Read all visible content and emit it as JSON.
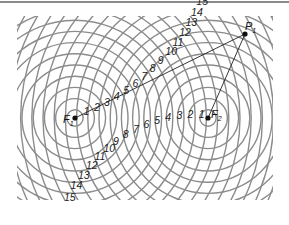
{
  "figure": {
    "sources": [
      {
        "id": "F1",
        "label": "F",
        "subscript": "1"
      },
      {
        "id": "F2",
        "label": "F",
        "subscript": "2"
      }
    ],
    "point": {
      "id": "P1",
      "label": "P",
      "subscript": "1"
    },
    "f1_ring_labels": [
      "1",
      "2",
      "3",
      "4",
      "5",
      "6",
      "7",
      "8",
      "9",
      "10",
      "11",
      "12",
      "13",
      "14",
      "15",
      "16"
    ],
    "f2_ring_labels": [
      "1",
      "2",
      "3",
      "4",
      "5",
      "6",
      "7",
      "8",
      "9",
      "10",
      "11",
      "12",
      "13",
      "14",
      "15"
    ],
    "colors": {
      "rings": "#8c8c8c",
      "ink": "#111111",
      "rule": "#8a8a8a"
    }
  }
}
